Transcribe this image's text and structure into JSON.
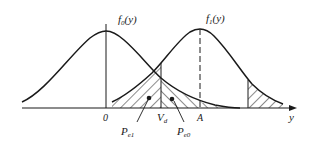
{
  "figure": {
    "type": "decision-threshold-diagram",
    "curves": [
      {
        "name": "f0",
        "label": "f",
        "subscript": "0",
        "arg": "(y)",
        "mean_label": "0"
      },
      {
        "name": "f1",
        "label": "f",
        "subscript": "1",
        "arg": "(y)",
        "mean_label": "A"
      }
    ],
    "threshold": {
      "label": "V",
      "subscript": "d"
    },
    "regions": [
      {
        "label": "P",
        "subscript": "e1"
      },
      {
        "label": "P",
        "subscript": "e0"
      }
    ],
    "axis": {
      "label": "y"
    },
    "colors": {
      "line": "#1a1a1a",
      "background": "#ffffff"
    }
  }
}
